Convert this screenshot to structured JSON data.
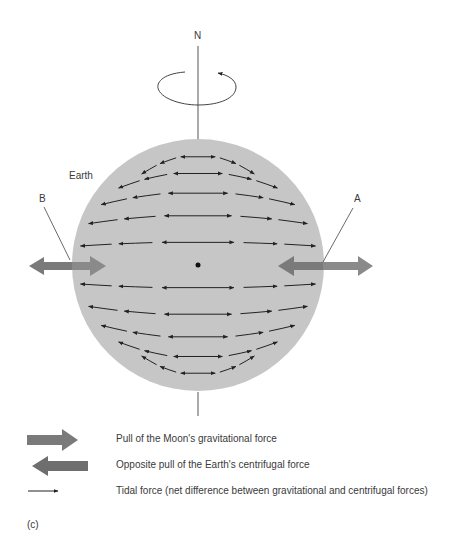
{
  "diagram": {
    "labels": {
      "north": "N",
      "earth": "Earth",
      "point_a": "A",
      "point_b": "B"
    },
    "panel_label": "(c)",
    "colors": {
      "earth_fill": "#c6c6c6",
      "force_arrow": "#7a7a7a",
      "tidal_arrow": "#222222",
      "axis_line": "#555555",
      "text": "#3a3a3a"
    }
  },
  "legend": {
    "items": [
      {
        "icon": "gravitational-force-arrow-right",
        "label": "Pull of the Moon's gravitational force"
      },
      {
        "icon": "centrifugal-force-arrow-left",
        "label": "Opposite pull of the Earth's centrifugal force"
      },
      {
        "icon": "tidal-force-arrow",
        "label": "Tidal force (net difference between gravitational and centrifugal forces)"
      }
    ]
  }
}
